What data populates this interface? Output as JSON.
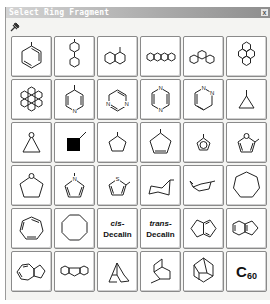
{
  "window": {
    "title": "Select Ring Fragment",
    "close_label": "x",
    "toolbar_icon": "pin-icon"
  },
  "fragments": [
    {
      "name": "benzene"
    },
    {
      "name": "biphenyl"
    },
    {
      "name": "naphthalene"
    },
    {
      "name": "anthracene"
    },
    {
      "name": "phenanthrene"
    },
    {
      "name": "pyrene"
    },
    {
      "name": "coronene"
    },
    {
      "name": "pyridine",
      "atom": "N"
    },
    {
      "name": "pyrimidine",
      "atom": "N"
    },
    {
      "name": "pyrazine",
      "atom": "N"
    },
    {
      "name": "pyridazine",
      "atom": "N"
    },
    {
      "name": "cyclopropane"
    },
    {
      "name": "oxirane",
      "atom": "O"
    },
    {
      "name": "cyclobutane"
    },
    {
      "name": "cyclopentane"
    },
    {
      "name": "cyclopentene"
    },
    {
      "name": "cyclopentadienyl"
    },
    {
      "name": "furan",
      "atom": "O"
    },
    {
      "name": "tetrahydrofuran",
      "atom": "O"
    },
    {
      "name": "pyrrole",
      "atom": "N"
    },
    {
      "name": "thiophene",
      "atom": "S"
    },
    {
      "name": "cyclohexane-chair"
    },
    {
      "name": "cyclohexane-boat"
    },
    {
      "name": "cycloheptane"
    },
    {
      "name": "cycloheptatriene"
    },
    {
      "name": "cyclooctane"
    },
    {
      "name": "cis-decalin",
      "prefix": "cis-",
      "label": "Decalin"
    },
    {
      "name": "trans-decalin",
      "prefix": "trans-",
      "label": "Decalin"
    },
    {
      "name": "pentalene"
    },
    {
      "name": "indene"
    },
    {
      "name": "azulene"
    },
    {
      "name": "fluorene"
    },
    {
      "name": "norbornane"
    },
    {
      "name": "bicyclooctane"
    },
    {
      "name": "adamantane"
    },
    {
      "name": "C60",
      "label": "C",
      "subscript": "60"
    }
  ]
}
